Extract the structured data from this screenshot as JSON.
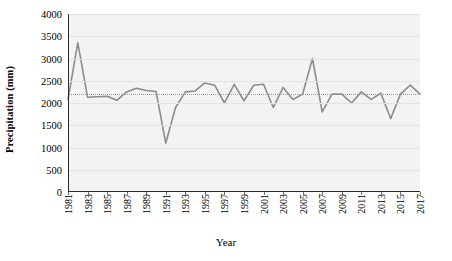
{
  "chart_data": {
    "type": "line",
    "title": "",
    "xlabel": "Year",
    "ylabel": "Precipitation (mm)",
    "xlim": [
      1981,
      2017
    ],
    "ylim": [
      0,
      4000
    ],
    "ytick_step": 500,
    "yticks": [
      4000,
      3500,
      3000,
      2500,
      2000,
      1500,
      1000,
      500,
      0
    ],
    "xticks": [
      1981,
      1983,
      1985,
      1987,
      1989,
      1991,
      1993,
      1995,
      1997,
      1999,
      2001,
      2003,
      2005,
      2007,
      2009,
      2011,
      2013,
      2015,
      2017
    ],
    "grid": true,
    "legend": "none",
    "line_color": "#8c8c8c",
    "plot_background": "#f3f3f3",
    "trendline": {
      "type": "horizontal-dotted",
      "value": 2200,
      "color": "#9a9a9a"
    },
    "x": [
      1981,
      1982,
      1983,
      1984,
      1985,
      1986,
      1987,
      1988,
      1989,
      1990,
      1991,
      1992,
      1993,
      1994,
      1995,
      1996,
      1997,
      1998,
      1999,
      2000,
      2001,
      2002,
      2003,
      2004,
      2005,
      2006,
      2007,
      2008,
      2009,
      2010,
      2011,
      2012,
      2013,
      2014,
      2015,
      2016,
      2017
    ],
    "values": [
      2080,
      3350,
      2130,
      2140,
      2150,
      2060,
      2250,
      2330,
      2280,
      2260,
      1100,
      1900,
      2250,
      2270,
      2450,
      2400,
      2000,
      2420,
      2050,
      2400,
      2420,
      1900,
      2350,
      2080,
      2200,
      3000,
      1800,
      2200,
      2200,
      2000,
      2250,
      2080,
      2220,
      1650,
      2200,
      2400,
      2200
    ],
    "series": [
      {
        "name": "Precipitation",
        "values": [
          2080,
          3350,
          2130,
          2140,
          2150,
          2060,
          2250,
          2330,
          2280,
          2260,
          1100,
          1900,
          2250,
          2270,
          2450,
          2400,
          2000,
          2420,
          2050,
          2400,
          2420,
          1900,
          2350,
          2080,
          2200,
          3000,
          1800,
          2200,
          2200,
          2000,
          2250,
          2080,
          2220,
          1650,
          2200,
          2400,
          2200
        ]
      }
    ],
    "annotations": []
  }
}
